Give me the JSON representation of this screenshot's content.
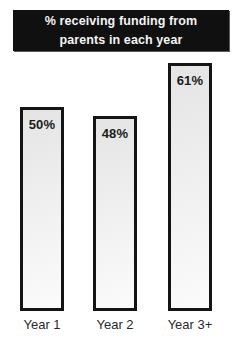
{
  "chart_data": {
    "type": "bar",
    "title": "% receiving funding from parents in each year",
    "categories": [
      "Year 1",
      "Year 2",
      "Year 3+"
    ],
    "values": [
      50,
      48,
      61
    ],
    "value_labels": [
      "50%",
      "48%",
      "61%"
    ],
    "xlabel": "",
    "ylabel": "",
    "ylim": [
      0,
      70
    ],
    "axes_visible": false,
    "grid": false,
    "legend": "none",
    "data_labels_position": "inside-top",
    "bar_fill_color": "#efefef",
    "bar_border_color": "#141414",
    "title_bg_color": "#101010",
    "title_text_color": "#f4f4f4"
  }
}
